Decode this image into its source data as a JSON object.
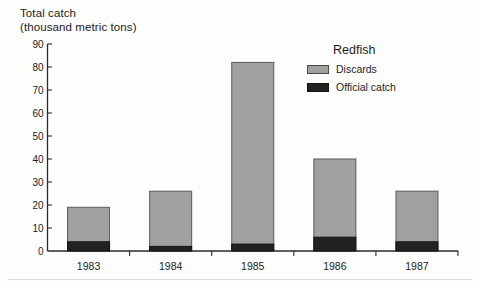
{
  "title": {
    "line1": "Total catch",
    "line2": "(thousand metric tons)"
  },
  "legend": {
    "title": "Redfish",
    "items": [
      {
        "label": "Discards",
        "swatch_color": "#a0a0a0",
        "swatch_border": "#4a4a4a"
      },
      {
        "label": "Official catch",
        "swatch_color": "#222222",
        "swatch_border": "#111111"
      }
    ]
  },
  "colors": {
    "background": "#fdfdfc",
    "text": "#1c1c1c",
    "axis": "#2a2a2a",
    "discards_fill": "#a0a0a0",
    "discards_border": "#5a5a5a",
    "official_fill": "#222222",
    "official_border": "#111111"
  },
  "chart_data": {
    "type": "bar",
    "stacked": true,
    "title": "Total catch (thousand metric tons)",
    "xlabel": "",
    "ylabel": "Total catch (thousand metric tons)",
    "categories": [
      "1983",
      "1984",
      "1985",
      "1986",
      "1987"
    ],
    "series": [
      {
        "name": "Official catch",
        "values": [
          4,
          2,
          3,
          6,
          4
        ],
        "color": "#222222"
      },
      {
        "name": "Discards",
        "values": [
          15,
          24,
          79,
          34,
          22
        ],
        "color": "#a0a0a0"
      }
    ],
    "totals": [
      19,
      26,
      82,
      40,
      26
    ],
    "ylim": [
      0,
      90
    ],
    "ytick_step": 10,
    "grid": false,
    "legend_title": "Redfish",
    "legend_position": "upper right"
  }
}
